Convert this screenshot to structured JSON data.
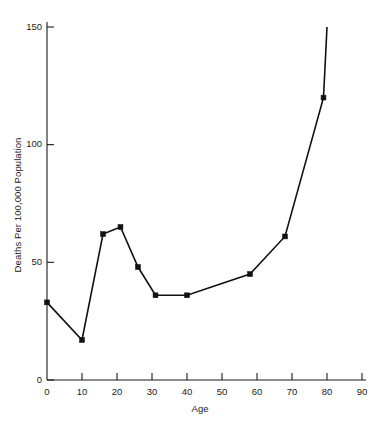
{
  "chart_data": {
    "type": "line",
    "title": "",
    "xlabel": "Age",
    "ylabel": "Deaths Per 100,000 Population",
    "xlim": [
      0,
      90
    ],
    "ylim": [
      0,
      150
    ],
    "xticks": [
      0,
      10,
      20,
      30,
      40,
      50,
      60,
      70,
      80,
      90
    ],
    "xtick_labels": [
      "0",
      "10",
      "20",
      "30",
      "40",
      "50",
      "60",
      "70",
      "80",
      "90"
    ],
    "yticks": [
      0,
      50,
      100,
      150
    ],
    "ytick_labels": [
      "0",
      "50",
      "100",
      "150"
    ],
    "grid": false,
    "legend": null,
    "marker": "square",
    "line_color": "#111111",
    "x": [
      0,
      10,
      16,
      21,
      26,
      31,
      40,
      58,
      68,
      79,
      80
    ],
    "values": [
      33,
      17,
      62,
      65,
      48,
      36,
      36,
      45,
      61,
      120,
      150
    ],
    "points": [
      {
        "x": 0,
        "y": 33,
        "marker": true
      },
      {
        "x": 10,
        "y": 17,
        "marker": true
      },
      {
        "x": 16,
        "y": 62,
        "marker": true
      },
      {
        "x": 21,
        "y": 65,
        "marker": true
      },
      {
        "x": 26,
        "y": 48,
        "marker": true
      },
      {
        "x": 31,
        "y": 36,
        "marker": true
      },
      {
        "x": 40,
        "y": 36,
        "marker": true
      },
      {
        "x": 58,
        "y": 45,
        "marker": true
      },
      {
        "x": 68,
        "y": 61,
        "marker": true
      },
      {
        "x": 79,
        "y": 120,
        "marker": true
      },
      {
        "x": 80,
        "y": 150,
        "marker": false
      }
    ]
  },
  "axes": {
    "x_title": "Age",
    "y_title": "Deaths Per 100,000 Population"
  }
}
